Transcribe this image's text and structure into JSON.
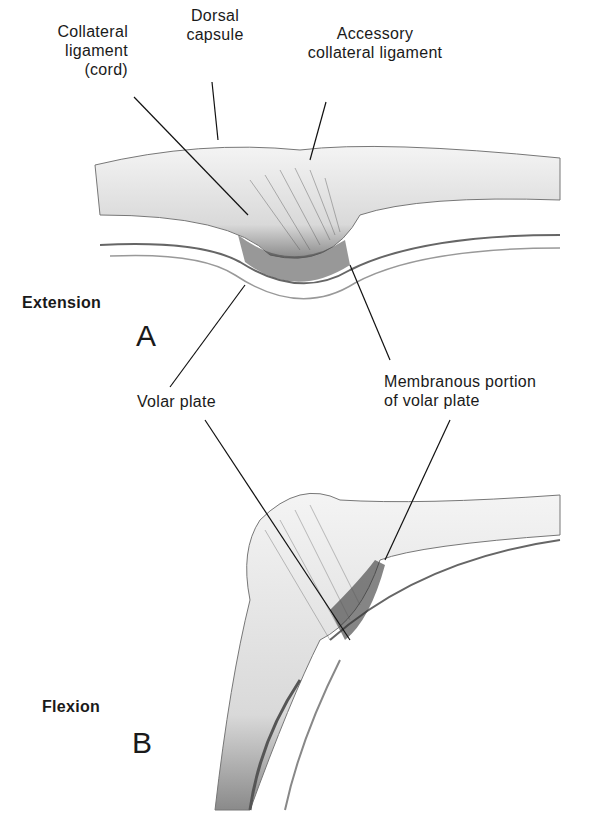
{
  "figure": {
    "panels": [
      {
        "id": "A",
        "letter": "A",
        "state": "Extension"
      },
      {
        "id": "B",
        "letter": "B",
        "state": "Flexion"
      }
    ],
    "labels": {
      "collateral_ligament": [
        "Collateral",
        "ligament",
        "(cord)"
      ],
      "dorsal_capsule": [
        "Dorsal",
        "capsule"
      ],
      "accessory_collateral_ligament": [
        "Accessory",
        "collateral ligament"
      ],
      "volar_plate": "Volar plate",
      "membranous_portion": [
        "Membranous portion",
        "of volar plate"
      ]
    }
  }
}
